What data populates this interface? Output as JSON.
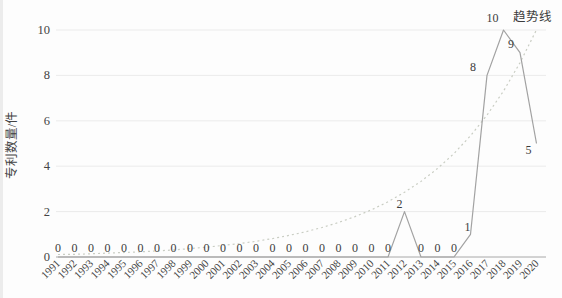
{
  "chart_data": {
    "type": "line",
    "title": "",
    "xlabel": "",
    "ylabel": "专利数量/件",
    "trend_label": "趋势线",
    "ylim": [
      0,
      10
    ],
    "yticks": [
      0,
      2,
      4,
      6,
      8,
      10
    ],
    "grid": true,
    "legend_position": "top-right-annotation",
    "categories": [
      "1991",
      "1992",
      "1993",
      "1994",
      "1995",
      "1996",
      "1997",
      "1998",
      "1999",
      "2000",
      "2001",
      "2002",
      "2003",
      "2004",
      "2005",
      "2006",
      "2007",
      "2008",
      "2009",
      "2010",
      "2011",
      "2012",
      "2013",
      "2014",
      "2015",
      "2016",
      "2017",
      "2018",
      "2019",
      "2020"
    ],
    "series": [
      {
        "name": "专利数量/件",
        "line_style": "solid",
        "color": "#a2a2a2",
        "show_labels": true,
        "values": [
          0,
          0,
          0,
          0,
          0,
          0,
          0,
          0,
          0,
          0,
          0,
          0,
          0,
          0,
          0,
          0,
          0,
          0,
          0,
          0,
          0,
          2,
          0,
          0,
          0,
          1,
          8,
          10,
          9,
          5
        ]
      },
      {
        "name": "趋势线",
        "line_style": "dotted",
        "color": "#c9cdc3",
        "show_labels": false,
        "values": [
          0.11,
          0.12,
          0.14,
          0.17,
          0.2,
          0.23,
          0.27,
          0.31,
          0.37,
          0.43,
          0.51,
          0.59,
          0.69,
          0.81,
          0.95,
          1.11,
          1.3,
          1.52,
          1.78,
          2.08,
          2.43,
          2.85,
          3.33,
          3.9,
          4.56,
          5.34,
          6.25,
          7.31,
          8.56,
          10.01
        ]
      }
    ],
    "label_offsets": {
      "21": [
        -5,
        -4
      ],
      "25": [
        -3,
        -3
      ],
      "26": [
        -14,
        -4
      ],
      "27": [
        -11,
        -8
      ],
      "28": [
        -9,
        -5
      ],
      "29": [
        -8,
        10
      ]
    },
    "default_label_offset": [
      0,
      -5
    ]
  },
  "colors": {
    "background": "#fdfdfd",
    "grid": "#ebebeb",
    "axis": "#a8a8a8",
    "text": "#3c3c3c",
    "tick_text": "#444444"
  }
}
